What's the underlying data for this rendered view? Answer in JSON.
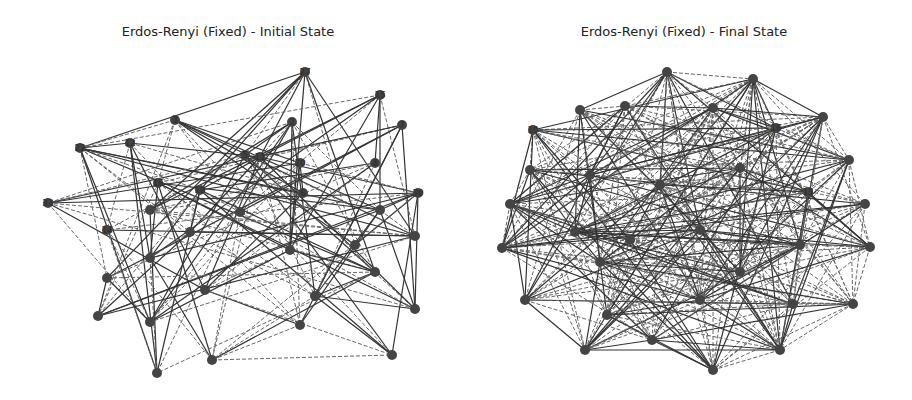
{
  "panels": [
    {
      "title": "Erdos-Renyi (Fixed) - Initial State",
      "nodes": [
        {
          "id": "27",
          "x": 305,
          "y": 72
        },
        {
          "id": "15",
          "x": 380,
          "y": 95
        },
        {
          "id": "7",
          "x": 402,
          "y": 125
        },
        {
          "id": "2",
          "x": 292,
          "y": 122
        },
        {
          "id": "3",
          "x": 175,
          "y": 120
        },
        {
          "id": "22",
          "x": 80,
          "y": 148
        },
        {
          "id": "12",
          "x": 130,
          "y": 143
        },
        {
          "id": "5",
          "x": 245,
          "y": 155
        },
        {
          "id": "11",
          "x": 260,
          "y": 157
        },
        {
          "id": "20",
          "x": 300,
          "y": 163
        },
        {
          "id": "4",
          "x": 375,
          "y": 163
        },
        {
          "id": "30",
          "x": 418,
          "y": 193
        },
        {
          "id": "16",
          "x": 158,
          "y": 183
        },
        {
          "id": "18",
          "x": 200,
          "y": 190
        },
        {
          "id": "6",
          "x": 303,
          "y": 193
        },
        {
          "id": "33",
          "x": 48,
          "y": 203
        },
        {
          "id": "",
          "x": 150,
          "y": 210
        },
        {
          "id": "",
          "x": 240,
          "y": 212
        },
        {
          "id": "",
          "x": 380,
          "y": 210
        },
        {
          "id": "14",
          "x": 107,
          "y": 230
        },
        {
          "id": "",
          "x": 190,
          "y": 232
        },
        {
          "id": "",
          "x": 290,
          "y": 250
        },
        {
          "id": "",
          "x": 355,
          "y": 245
        },
        {
          "id": "",
          "x": 415,
          "y": 236
        },
        {
          "id": "",
          "x": 150,
          "y": 258
        },
        {
          "id": "",
          "x": 375,
          "y": 272
        },
        {
          "id": "",
          "x": 107,
          "y": 278
        },
        {
          "id": "",
          "x": 205,
          "y": 290
        },
        {
          "id": "",
          "x": 315,
          "y": 296
        },
        {
          "id": "",
          "x": 415,
          "y": 309
        },
        {
          "id": "",
          "x": 98,
          "y": 316
        },
        {
          "id": "",
          "x": 150,
          "y": 322
        },
        {
          "id": "",
          "x": 300,
          "y": 325
        },
        {
          "id": "",
          "x": 212,
          "y": 360
        },
        {
          "id": "",
          "x": 392,
          "y": 355
        },
        {
          "id": "",
          "x": 157,
          "y": 373
        }
      ]
    },
    {
      "title": "Erdos-Renyi (Fixed) - Final State",
      "nodes": [
        {
          "id": "",
          "x": 667,
          "y": 72
        },
        {
          "id": "",
          "x": 753,
          "y": 79
        },
        {
          "id": "",
          "x": 580,
          "y": 110
        },
        {
          "id": "",
          "x": 625,
          "y": 106
        },
        {
          "id": "",
          "x": 713,
          "y": 108
        },
        {
          "id": "10",
          "x": 533,
          "y": 130
        },
        {
          "id": "",
          "x": 823,
          "y": 117
        },
        {
          "id": "16",
          "x": 776,
          "y": 128
        },
        {
          "id": "",
          "x": 849,
          "y": 160
        },
        {
          "id": "",
          "x": 530,
          "y": 170
        },
        {
          "id": "",
          "x": 590,
          "y": 175
        },
        {
          "id": "",
          "x": 660,
          "y": 185
        },
        {
          "id": "",
          "x": 740,
          "y": 168
        },
        {
          "id": "13",
          "x": 808,
          "y": 192
        },
        {
          "id": "",
          "x": 865,
          "y": 204
        },
        {
          "id": "",
          "x": 510,
          "y": 204
        },
        {
          "id": "",
          "x": 575,
          "y": 232
        },
        {
          "id": "",
          "x": 630,
          "y": 240
        },
        {
          "id": "",
          "x": 700,
          "y": 230
        },
        {
          "id": "",
          "x": 800,
          "y": 245
        },
        {
          "id": "",
          "x": 870,
          "y": 247
        },
        {
          "id": "",
          "x": 502,
          "y": 248
        },
        {
          "id": "",
          "x": 600,
          "y": 262
        },
        {
          "id": "",
          "x": 740,
          "y": 272
        },
        {
          "id": "",
          "x": 525,
          "y": 300
        },
        {
          "id": "",
          "x": 607,
          "y": 315
        },
        {
          "id": "",
          "x": 700,
          "y": 300
        },
        {
          "id": "",
          "x": 793,
          "y": 304
        },
        {
          "id": "",
          "x": 853,
          "y": 304
        },
        {
          "id": "",
          "x": 652,
          "y": 340
        },
        {
          "id": "",
          "x": 585,
          "y": 350
        },
        {
          "id": "",
          "x": 780,
          "y": 350
        },
        {
          "id": "",
          "x": 713,
          "y": 370
        }
      ]
    }
  ]
}
